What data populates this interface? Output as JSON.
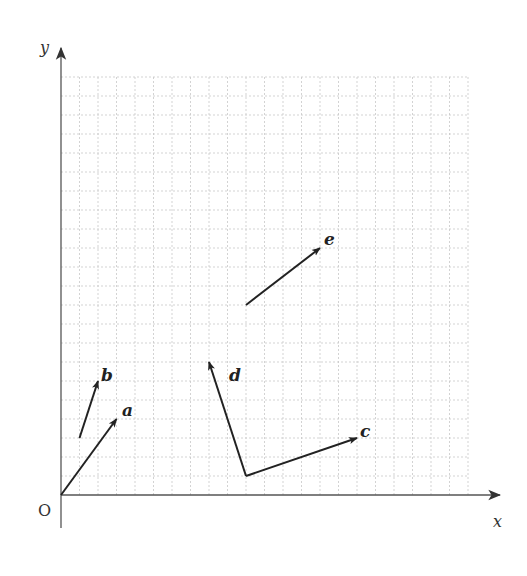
{
  "diagram": {
    "type": "vector-grid",
    "axes": {
      "x_label": "x",
      "y_label": "y",
      "origin_label": "O"
    },
    "grid": {
      "columns": 22,
      "rows": 22,
      "line_color": "#c8c8c8",
      "axis_color": "#555555",
      "vector_color": "#222222"
    },
    "vectors": [
      {
        "label": "a",
        "start": [
          0,
          0
        ],
        "end": [
          3,
          4
        ]
      },
      {
        "label": "b",
        "start": [
          1,
          3
        ],
        "end": [
          2,
          6
        ]
      },
      {
        "label": "c",
        "start": [
          10,
          1
        ],
        "end": [
          16,
          3
        ]
      },
      {
        "label": "d",
        "start": [
          10,
          1
        ],
        "end": [
          8,
          7
        ]
      },
      {
        "label": "e",
        "start": [
          10,
          10
        ],
        "end": [
          14,
          13
        ]
      }
    ]
  }
}
